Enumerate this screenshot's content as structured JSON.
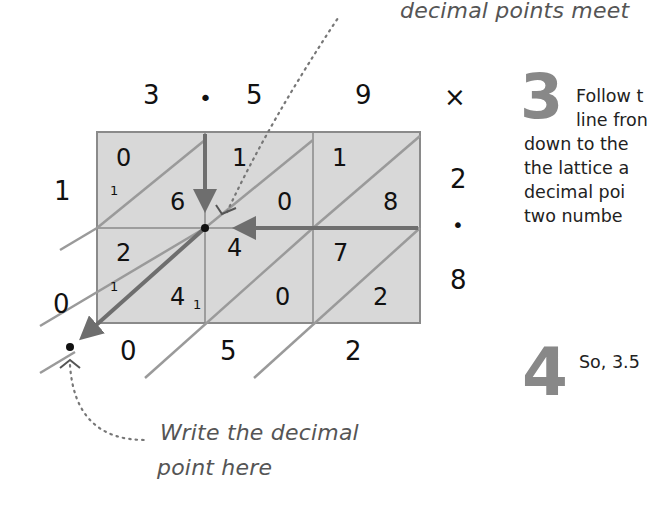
{
  "annotations": {
    "top_note": "decimal points meet",
    "bottom_note_line1": "Write the decimal",
    "bottom_note_line2": "point here"
  },
  "multiplicand": {
    "digits": [
      "3",
      "5",
      "9"
    ],
    "decimal_point": "•"
  },
  "multiplier": {
    "digits": [
      "2",
      "8"
    ],
    "decimal_point": "•",
    "times_sign": "×"
  },
  "lattice": {
    "cells": [
      [
        {
          "tens": "0",
          "units": "6"
        },
        {
          "tens": "1",
          "units": "0"
        },
        {
          "tens": "1",
          "units": "8"
        }
      ],
      [
        {
          "tens": "2",
          "units": "4"
        },
        {
          "tens": "4",
          "units": "0"
        },
        {
          "tens": "7",
          "units": "2"
        }
      ]
    ],
    "carries": {
      "row1_left": "1",
      "row2_left": "1",
      "row2_col1_sub": "1"
    },
    "left_results": [
      "1",
      "0"
    ],
    "bottom_results": [
      "0",
      "5",
      "2"
    ]
  },
  "steps": [
    {
      "number": "3",
      "lines": [
        "Follow t",
        "line fron",
        "down to the",
        "the lattice a",
        "decimal poi",
        "two numbe"
      ]
    },
    {
      "number": "4",
      "lines": [
        "So, 3.5"
      ]
    }
  ],
  "colors": {
    "grid_fill": "#d8d8d8",
    "grid_line": "#8a8a8a",
    "arrow": "#6e6e6e",
    "diagonal": "#9a9a9a",
    "step_number": "#888888",
    "note_text": "#555555"
  }
}
